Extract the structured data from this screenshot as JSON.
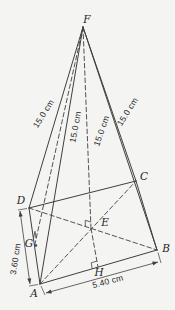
{
  "diagram": {
    "kind": "geometric-figure-pyramid",
    "canvas": {
      "width": 175,
      "height": 310
    },
    "colors": {
      "background": "#f4f4f3",
      "stroke": "#3f3f3f",
      "text": "#1f1f1f"
    },
    "vertices": [
      {
        "id": "F",
        "x": 83,
        "y": 27,
        "lx": 87,
        "ly": 23
      },
      {
        "id": "A",
        "x": 40,
        "y": 284,
        "lx": 34,
        "ly": 297
      },
      {
        "id": "B",
        "x": 157,
        "y": 250,
        "lx": 166,
        "ly": 252
      },
      {
        "id": "C",
        "x": 136,
        "y": 181,
        "lx": 144,
        "ly": 180
      },
      {
        "id": "D",
        "x": 29,
        "y": 208,
        "lx": 21,
        "ly": 204
      },
      {
        "id": "E",
        "x": 91,
        "y": 228.5,
        "lx": 105,
        "ly": 226
      },
      {
        "id": "G",
        "x": 34.5,
        "y": 246,
        "lx": 29,
        "ly": 247
      },
      {
        "id": "H",
        "x": 98,
        "y": 267,
        "lx": 99,
        "ly": 276
      }
    ],
    "edges": [
      {
        "from": "F",
        "to": "A",
        "style": "solid"
      },
      {
        "from": "F",
        "to": "B",
        "style": "solid"
      },
      {
        "from": "F",
        "to": "C",
        "style": "solid"
      },
      {
        "from": "F",
        "to": "D",
        "style": "solid"
      },
      {
        "from": "A",
        "to": "B",
        "style": "solid"
      },
      {
        "from": "B",
        "to": "C",
        "style": "solid"
      },
      {
        "from": "C",
        "to": "D",
        "style": "solid"
      },
      {
        "from": "D",
        "to": "A",
        "style": "solid"
      },
      {
        "from": "F",
        "to": "E",
        "style": "dashed"
      },
      {
        "from": "E",
        "to": "H",
        "style": "dashed"
      },
      {
        "from": "F",
        "to": "G",
        "style": "dashed"
      },
      {
        "from": "A",
        "to": "C",
        "style": "dashed"
      },
      {
        "from": "D",
        "to": "B",
        "style": "dashed"
      }
    ],
    "dimension_labels": [
      {
        "text": "15.0 cm",
        "x": 44,
        "y": 114,
        "rotate": -58,
        "edge": "FD"
      },
      {
        "text": "15.0 cm",
        "x": 76,
        "y": 127,
        "rotate": -79,
        "edge": "FA"
      },
      {
        "text": "15.0 cm",
        "x": 102,
        "y": 131,
        "rotate": -71,
        "edge": "FC"
      },
      {
        "text": "15.0 cm",
        "x": 128,
        "y": 112,
        "rotate": -58,
        "edge": "FB"
      },
      {
        "text": "3.60 cm",
        "x": 16,
        "y": 259,
        "rotate": -81,
        "edge": "AD"
      },
      {
        "text": "5.40 cm",
        "x": 108,
        "y": 282,
        "rotate": -15,
        "edge": "AB"
      }
    ],
    "dimension_lines": [
      {
        "edge": "AD",
        "x1": 20,
        "y1": 211,
        "x2": 30,
        "y2": 284
      },
      {
        "edge": "AB",
        "x1": 46,
        "y1": 293,
        "x2": 158,
        "y2": 262
      }
    ],
    "extension_ticks": [
      {
        "x1": 27,
        "y1": 208.5,
        "x2": 18,
        "y2": 210
      },
      {
        "x1": 38,
        "y1": 284.5,
        "x2": 29,
        "y2": 286
      },
      {
        "x1": 41,
        "y1": 286,
        "x2": 45,
        "y2": 295
      },
      {
        "x1": 158,
        "y1": 252.5,
        "x2": 161,
        "y2": 263
      }
    ],
    "right_angle_marks": [
      {
        "at": "E",
        "points": "90.8,222 85.2,220.3 85.4,226.2"
      },
      {
        "at": "G",
        "points": "36,238.2 35,231.3 33.5,238.1"
      },
      {
        "at": "H",
        "points": "96.9,261.1 91.2,262.8 92.2,268.7"
      }
    ],
    "point_dots": [
      {
        "at": "G",
        "x": 36,
        "y": 245.5
      }
    ]
  }
}
